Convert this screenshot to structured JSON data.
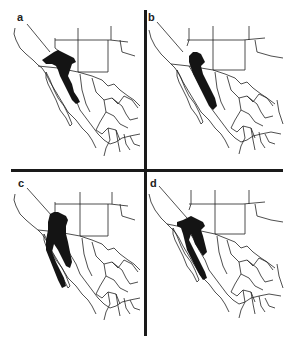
{
  "figure": {
    "panels": [
      {
        "label": "a",
        "position": "top-left"
      },
      {
        "label": "b",
        "position": "top-right"
      },
      {
        "label": "c",
        "position": "bottom-left"
      },
      {
        "label": "d",
        "position": "bottom-right"
      }
    ],
    "colors": {
      "range_fill": "#141414",
      "border_stroke": "#222222",
      "divider": "#1a1a1a",
      "background": "#ffffff"
    }
  }
}
